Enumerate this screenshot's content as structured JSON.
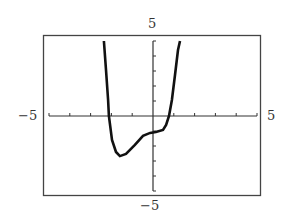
{
  "chart_data": {
    "type": "line",
    "title": "",
    "xlabel": "",
    "ylabel": "",
    "xlim": [
      -5,
      5
    ],
    "ylim": [
      -5,
      5
    ],
    "x_tick_step": 1,
    "y_tick_step": 1,
    "grid": false,
    "legend": null,
    "tick_labels": {
      "x_min": "−5",
      "x_max": "5",
      "y_min": "−5",
      "y_max": "5"
    },
    "series": [
      {
        "name": "f(x)",
        "style": "calculator-pixel",
        "color": "#111111",
        "x": [
          -2.36,
          -2.26,
          -2.16,
          -2.12,
          -1.97,
          -1.78,
          -1.59,
          -1.3,
          -0.87,
          -0.48,
          -0.14,
          0.14,
          0.48,
          0.63,
          0.77,
          0.91,
          1.06,
          1.2,
          1.3
        ],
        "y": [
          5,
          3.07,
          1.07,
          0,
          -1.6,
          -2.4,
          -2.67,
          -2.53,
          -1.93,
          -1.33,
          -1.13,
          -1.07,
          -0.93,
          -0.6,
          0,
          1.07,
          2.73,
          4.4,
          5
        ]
      }
    ]
  },
  "frame": {
    "stroke": "#444444",
    "axis_color": "#333333",
    "curve_color": "#111111"
  }
}
